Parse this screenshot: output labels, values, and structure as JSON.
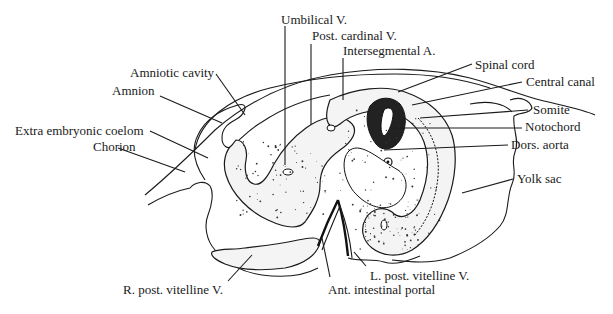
{
  "figure": {
    "top_fragment": "",
    "labels": {
      "umbilical_v": "Umbilical V.",
      "post_cardinal_v": "Post. cardinal V.",
      "intersegmental_a": "Intersegmental A.",
      "amniotic_cavity": "Amniotic cavity",
      "amnion": "Amnion",
      "extra_embryonic_coelom": "Extra embryonic coelom",
      "chorion": "Chorion",
      "spinal_cord": "Spinal cord",
      "central_canal": "Central canal",
      "somite": "Somite",
      "notochord": "Notochord",
      "dors_aorta": "Dors. aorta",
      "yolk_sac": "Yolk sac",
      "r_post_vitelline_v": "R. post. vitelline V.",
      "l_post_vitelline_v": "L. post. vitelline V.",
      "ant_intestinal_portal": "Ant. intestinal portal"
    }
  }
}
